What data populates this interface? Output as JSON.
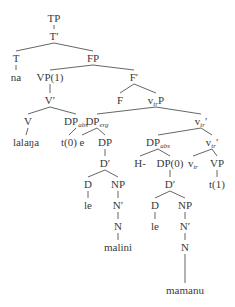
{
  "diagram": {
    "type": "syntax-tree",
    "nodes": [
      {
        "id": "tp",
        "label": "TP",
        "sub": "",
        "prime": "",
        "x": 54,
        "y": 12
      },
      {
        "id": "tbar",
        "label": "T",
        "sub": "",
        "prime": "′",
        "x": 54,
        "y": 30
      },
      {
        "id": "t",
        "label": "T",
        "sub": "",
        "prime": "",
        "x": 16,
        "y": 52
      },
      {
        "id": "fp",
        "label": "FP",
        "sub": "",
        "prime": "",
        "x": 93,
        "y": 52
      },
      {
        "id": "na",
        "label": "na",
        "sub": "",
        "prime": "",
        "x": 16,
        "y": 71
      },
      {
        "id": "vp1",
        "label": "VP(1)",
        "sub": "",
        "prime": "",
        "x": 50,
        "y": 71
      },
      {
        "id": "fbar",
        "label": "F",
        "sub": "",
        "prime": "′",
        "x": 134,
        "y": 71
      },
      {
        "id": "vbar",
        "label": "V",
        "sub": "",
        "prime": "′",
        "x": 50,
        "y": 94
      },
      {
        "id": "f",
        "label": "F",
        "sub": "",
        "prime": "",
        "x": 120,
        "y": 94
      },
      {
        "id": "vtrp",
        "label": "v",
        "sub": "tr",
        "prime": "P",
        "x": 156,
        "y": 94
      },
      {
        "id": "v",
        "label": "V",
        "sub": "",
        "prime": "",
        "x": 28,
        "y": 115
      },
      {
        "id": "dpabs1",
        "label": "DP",
        "sub": "abs",
        "prime": "",
        "x": 76,
        "y": 115
      },
      {
        "id": "dperg",
        "label": "DP",
        "sub": "erg",
        "prime": "",
        "x": 97,
        "y": 115
      },
      {
        "id": "vtrbar1",
        "label": "v",
        "sub": "tr",
        "prime": "′",
        "x": 201,
        "y": 115
      },
      {
        "id": "lalana",
        "label": "lalaŋa",
        "sub": "",
        "prime": "",
        "x": 26,
        "y": 136
      },
      {
        "id": "t0",
        "label": "t(0)",
        "sub": "",
        "prime": "",
        "x": 69,
        "y": 136
      },
      {
        "id": "e",
        "label": "e",
        "sub": "",
        "prime": "",
        "x": 82,
        "y": 136
      },
      {
        "id": "dp",
        "label": "DP",
        "sub": "",
        "prime": "",
        "x": 105,
        "y": 136
      },
      {
        "id": "dpabs2",
        "label": "DP",
        "sub": "abs",
        "prime": "",
        "x": 158,
        "y": 136
      },
      {
        "id": "vtrbar2",
        "label": "v",
        "sub": "tr",
        "prime": "′",
        "x": 212,
        "y": 136
      },
      {
        "id": "dbar1",
        "label": "D",
        "sub": "",
        "prime": "′",
        "x": 105,
        "y": 157
      },
      {
        "id": "h",
        "label": "H-",
        "sub": "",
        "prime": "",
        "x": 140,
        "y": 157
      },
      {
        "id": "dp0",
        "label": "DP(0)",
        "sub": "",
        "prime": "",
        "x": 170,
        "y": 157
      },
      {
        "id": "vtr",
        "label": "v",
        "sub": "tr",
        "prime": "",
        "x": 193,
        "y": 157
      },
      {
        "id": "vp",
        "label": "VP",
        "sub": "",
        "prime": "",
        "x": 217,
        "y": 157
      },
      {
        "id": "d1",
        "label": "D",
        "sub": "",
        "prime": "",
        "x": 88,
        "y": 178
      },
      {
        "id": "np1",
        "label": "NP",
        "sub": "",
        "prime": "",
        "x": 118,
        "y": 178
      },
      {
        "id": "dbar2",
        "label": "D",
        "sub": "",
        "prime": "′",
        "x": 170,
        "y": 178
      },
      {
        "id": "t1",
        "label": "t(1)",
        "sub": "",
        "prime": "",
        "x": 217,
        "y": 178
      },
      {
        "id": "le1",
        "label": "le",
        "sub": "",
        "prime": "",
        "x": 88,
        "y": 199
      },
      {
        "id": "nbar1",
        "label": "N",
        "sub": "",
        "prime": "′",
        "x": 118,
        "y": 199
      },
      {
        "id": "d2",
        "label": "D",
        "sub": "",
        "prime": "",
        "x": 155,
        "y": 199
      },
      {
        "id": "np2",
        "label": "NP",
        "sub": "",
        "prime": "",
        "x": 185,
        "y": 199
      },
      {
        "id": "n1",
        "label": "N",
        "sub": "",
        "prime": "",
        "x": 118,
        "y": 220
      },
      {
        "id": "le2",
        "label": "le",
        "sub": "",
        "prime": "",
        "x": 155,
        "y": 220
      },
      {
        "id": "nbar2",
        "label": "N",
        "sub": "",
        "prime": "′",
        "x": 185,
        "y": 220
      },
      {
        "id": "malini",
        "label": "malini",
        "sub": "",
        "prime": "",
        "x": 118,
        "y": 241
      },
      {
        "id": "n2",
        "label": "N",
        "sub": "",
        "prime": "",
        "x": 185,
        "y": 241
      },
      {
        "id": "mamanu",
        "label": "mamanu",
        "sub": "",
        "prime": "",
        "x": 185,
        "y": 284
      }
    ],
    "edges": [
      [
        "tp",
        "tbar"
      ],
      [
        "tbar",
        "t"
      ],
      [
        "tbar",
        "fp"
      ],
      [
        "t",
        "na"
      ],
      [
        "fp",
        "vp1"
      ],
      [
        "fp",
        "fbar"
      ],
      [
        "vp1",
        "vbar"
      ],
      [
        "fbar",
        "f"
      ],
      [
        "fbar",
        "vtrp"
      ],
      [
        "vbar",
        "v"
      ],
      [
        "vbar",
        "dpabs1"
      ],
      [
        "vtrp",
        "dperg"
      ],
      [
        "vtrp",
        "vtrbar1"
      ],
      [
        "v",
        "lalana"
      ],
      [
        "dpabs1",
        "t0"
      ],
      [
        "dperg",
        "e"
      ],
      [
        "dperg",
        "dp"
      ],
      [
        "vtrbar1",
        "dpabs2"
      ],
      [
        "vtrbar1",
        "vtrbar2"
      ],
      [
        "dp",
        "dbar1"
      ],
      [
        "dpabs2",
        "h"
      ],
      [
        "dpabs2",
        "dp0"
      ],
      [
        "vtrbar2",
        "vtr"
      ],
      [
        "vtrbar2",
        "vp"
      ],
      [
        "dbar1",
        "d1"
      ],
      [
        "dbar1",
        "np1"
      ],
      [
        "dp0",
        "dbar2"
      ],
      [
        "vp",
        "t1"
      ],
      [
        "d1",
        "le1"
      ],
      [
        "np1",
        "nbar1"
      ],
      [
        "dbar2",
        "d2"
      ],
      [
        "dbar2",
        "np2"
      ],
      [
        "nbar1",
        "n1"
      ],
      [
        "d2",
        "le2"
      ],
      [
        "np2",
        "nbar2"
      ],
      [
        "n1",
        "malini"
      ],
      [
        "nbar2",
        "n2"
      ],
      [
        "n2",
        "mamanu"
      ]
    ],
    "line_color": "#555555"
  }
}
